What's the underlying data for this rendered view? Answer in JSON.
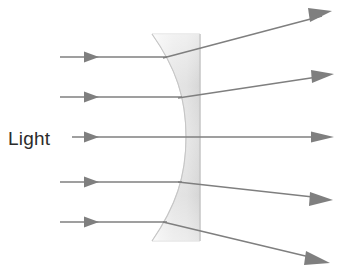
{
  "diagram": {
    "type": "optics-ray-diagram",
    "canvas": {
      "width": 345,
      "height": 280,
      "background": "#ffffff"
    },
    "labels": {
      "light": "Light"
    },
    "colors": {
      "ray": "#808080",
      "ray_dark": "#6e6e6e",
      "label_text": "#2b2b2b",
      "lens_fill_light": "#f2f2f2",
      "lens_fill_mid": "#dcdcdc",
      "lens_edge": "#c8c8c8",
      "background": "#ffffff"
    },
    "lens": {
      "name": "plano-concave-diverging-lens",
      "type": "concave",
      "top_y": 34,
      "bottom_y": 241,
      "flat_edge_x": 200,
      "left_top_x": 152,
      "left_bottom_x": 152,
      "waist_x": 186,
      "waist_y": 137
    },
    "incoming_rays": [
      {
        "name": "incoming-ray-1",
        "x1": 60,
        "y1": 57,
        "x2": 165,
        "y2": 57,
        "arrow_x": 93
      },
      {
        "name": "incoming-ray-2",
        "x1": 60,
        "y1": 97,
        "x2": 180,
        "y2": 97,
        "arrow_x": 93
      },
      {
        "name": "incoming-ray-3",
        "x1": 72,
        "y1": 137,
        "x2": 200,
        "y2": 137,
        "arrow_x": 93
      },
      {
        "name": "incoming-ray-4",
        "x1": 60,
        "y1": 182,
        "x2": 180,
        "y2": 182,
        "arrow_x": 93
      },
      {
        "name": "incoming-ray-5",
        "x1": 60,
        "y1": 222,
        "x2": 165,
        "y2": 222,
        "arrow_x": 93
      }
    ],
    "outgoing_rays": [
      {
        "name": "outgoing-ray-1",
        "x1": 165,
        "y1": 57,
        "x2": 330,
        "y2": 13
      },
      {
        "name": "outgoing-ray-2",
        "x1": 180,
        "y1": 97,
        "x2": 332,
        "y2": 75
      },
      {
        "name": "outgoing-ray-3",
        "x1": 200,
        "y1": 137,
        "x2": 332,
        "y2": 137
      },
      {
        "name": "outgoing-ray-4",
        "x1": 180,
        "y1": 182,
        "x2": 330,
        "y2": 199
      },
      {
        "name": "outgoing-ray-5",
        "x1": 165,
        "y1": 222,
        "x2": 327,
        "y2": 262
      }
    ],
    "light_label_position": {
      "x": 8,
      "y": 145
    }
  }
}
